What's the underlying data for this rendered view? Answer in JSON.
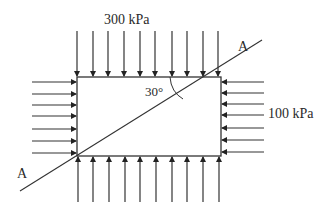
{
  "diagram": {
    "type": "stress-element",
    "labels": {
      "vertical_stress": "300 kPa",
      "horizontal_stress": "100 kPa",
      "angle": "30°",
      "plane_top": "A",
      "plane_bottom": "A"
    },
    "colors": {
      "line": "#333333",
      "background": "#ffffff"
    },
    "element_box": {
      "x": 77,
      "y": 77,
      "width": 144,
      "height": 79
    },
    "top_arrows_x": [
      77,
      93,
      108,
      124,
      140,
      155,
      172,
      187,
      203,
      218
    ],
    "bottom_arrows_x": [
      78,
      93,
      109,
      125,
      140,
      156,
      172,
      187,
      203,
      219
    ],
    "left_arrows_y": [
      82,
      94,
      105,
      116,
      129,
      141,
      153
    ],
    "right_arrows_y": [
      82,
      93,
      104,
      115,
      128,
      140,
      152
    ],
    "plane_line": {
      "x1": 20,
      "y1": 191,
      "x2": 262,
      "y2": 40
    }
  }
}
